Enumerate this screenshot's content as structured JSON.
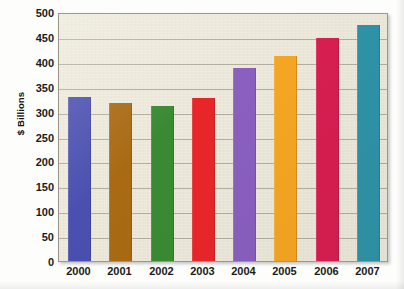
{
  "chart_data": {
    "type": "bar",
    "title": "",
    "subtitle": "",
    "xlabel": "",
    "ylabel": "$ Billions",
    "categories": [
      "2000",
      "2001",
      "2002",
      "2003",
      "2004",
      "2005",
      "2006",
      "2007"
    ],
    "values": [
      330,
      318,
      312,
      327,
      387,
      411,
      447,
      474
    ],
    "series": [
      {
        "name": "$ Billions",
        "values": [
          330,
          318,
          312,
          327,
          387,
          411,
          447,
          474
        ]
      }
    ],
    "bar_colors": [
      "#4a4fb0",
      "#a96a13",
      "#3a8a33",
      "#e8262a",
      "#8a5fc0",
      "#f5a623",
      "#d81e51",
      "#2f93a8"
    ],
    "ylim": [
      0,
      500
    ],
    "y_ticks": [
      0,
      50,
      100,
      150,
      200,
      250,
      300,
      350,
      400,
      450,
      500
    ],
    "y_tick_labels": [
      "0",
      "50",
      "100",
      "150",
      "200",
      "250",
      "300",
      "350",
      "400",
      "450",
      "500"
    ],
    "grid": "horizontal",
    "legend": "none",
    "plot_background": "#ece8d9",
    "plot_border_color": "#9a968c",
    "annotations": []
  }
}
